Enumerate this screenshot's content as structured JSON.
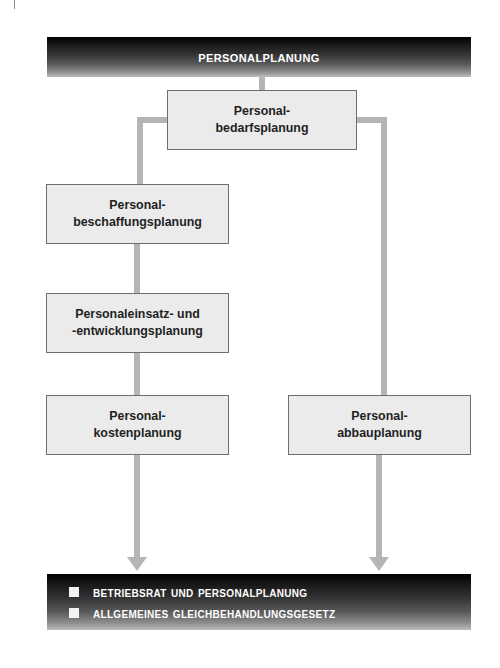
{
  "running_head": {
    "label": "1.1 PREVIEW"
  },
  "header_bar": {
    "title": "Personalplanung"
  },
  "nodes": {
    "bedarf": "Personal-\nbedarfsplanung",
    "beschaffung": "Personal-\nbeschaffungsplanung",
    "einsatz": "Personaleinsatz- und\n-entwicklungsplanung",
    "kosten": "Personal-\nkostenplanung",
    "abbau": "Personal-\nabbauplanung"
  },
  "footer_bar": {
    "items": [
      {
        "label": "Betriebsrat und Personalplanung"
      },
      {
        "label": "Allgemeines Gleichbehandlungsgesetz"
      }
    ]
  },
  "colors": {
    "box_fill": "#ebebeb",
    "box_border": "#6e6e6e",
    "connector": "#b5b5b5",
    "bar_dark": "#000000",
    "bar_light": "#bdbdbd",
    "text_dark": "#1f1f1f",
    "text_light": "#ffffff"
  },
  "diagram_structure": {
    "type": "flowchart",
    "root": "Personalplanung",
    "level1": "Personal-bedarfsplanung",
    "left_branch": [
      "Personal-beschaffungsplanung",
      "Personaleinsatz- und -entwicklungsplanung",
      "Personal-kostenplanung"
    ],
    "right_branch": [
      "Personal-abbauplanung"
    ],
    "terminal": "Betriebsrat und Personalplanung / Allgemeines Gleichbehandlungsgesetz"
  }
}
